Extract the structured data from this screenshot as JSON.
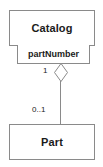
{
  "diagram": {
    "type": "uml-class-diagram",
    "notation": "qualified aggregation association",
    "canvas": {
      "width": 103,
      "height": 167,
      "background": "#ffffff"
    },
    "colors": {
      "border": "#8a8a8a",
      "text": "#1b1b1b",
      "fill": "#ffffff"
    },
    "classes": [
      {
        "id": "catalog",
        "name": "Catalog"
      },
      {
        "id": "part",
        "name": "Part"
      }
    ],
    "qualifier": {
      "label": "partNumber",
      "owner": "Catalog"
    },
    "association": {
      "source_multiplicity": "1",
      "target_multiplicity": "0..1",
      "source_end_marker": "hollow-diamond-aggregation",
      "target_end_marker": "none"
    }
  }
}
